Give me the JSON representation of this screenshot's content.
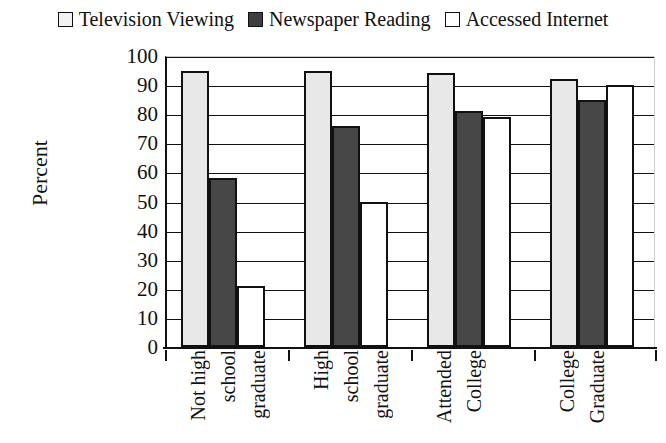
{
  "chart_data": {
    "type": "bar",
    "title": "",
    "xlabel": "",
    "ylabel": "Percent",
    "ylim": [
      0,
      100
    ],
    "yticks": [
      0,
      10,
      20,
      30,
      40,
      50,
      60,
      70,
      80,
      90,
      100
    ],
    "grid": true,
    "legend_position": "top",
    "categories": [
      "Not high school graduate",
      "High school graduate",
      "Attended College",
      "College Graduate"
    ],
    "category_words": [
      [
        "Not high",
        "school",
        "graduate"
      ],
      [
        "High",
        "school",
        "graduate"
      ],
      [
        "Attended",
        "College"
      ],
      [
        "College",
        "Graduate"
      ]
    ],
    "series": [
      {
        "name": "Television Viewing",
        "color": "#e8e8e8",
        "values": [
          95,
          95,
          94,
          92
        ]
      },
      {
        "name": "Newspaper Reading",
        "color": "#474747",
        "values": [
          58,
          76,
          81,
          85
        ]
      },
      {
        "name": "Accessed Internet",
        "color": "#ffffff",
        "values": [
          21,
          50,
          79,
          90
        ]
      }
    ]
  },
  "legend": {
    "items": [
      {
        "label": "Television Viewing",
        "swatch": "light-gray-square"
      },
      {
        "label": "Newspaper Reading",
        "swatch": "dark-gray-square"
      },
      {
        "label": "Accessed Internet",
        "swatch": "white-square"
      }
    ]
  },
  "axis": {
    "y_title": "Percent"
  }
}
